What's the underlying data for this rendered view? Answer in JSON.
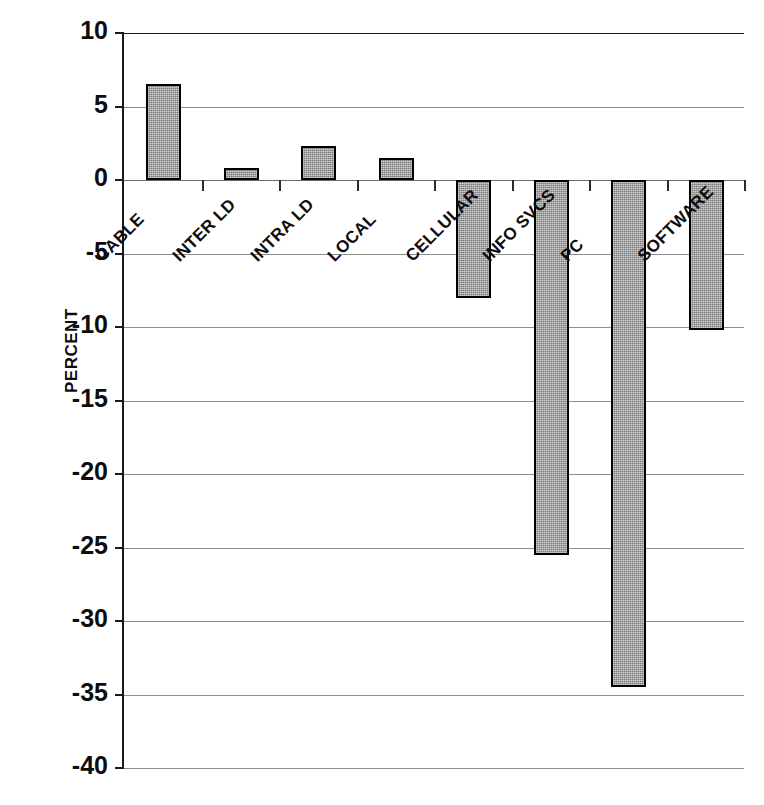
{
  "chart_data": {
    "type": "bar",
    "title": "",
    "xlabel": "",
    "ylabel": "PERCENT",
    "categories": [
      "CABLE",
      "INTER LD",
      "INTRA LD",
      "LOCAL",
      "CELLULAR",
      "INFO SVCS",
      "PC",
      "SOFTWARE"
    ],
    "values": [
      6.5,
      0.8,
      2.3,
      1.5,
      -8.0,
      -25.5,
      -34.5,
      -10.2
    ],
    "ylim": [
      -40,
      10
    ],
    "ytick_values": [
      10,
      5,
      0,
      -5,
      -10,
      -15,
      -20,
      -25,
      -30,
      -35,
      -40
    ],
    "ytick_labels": [
      "10",
      "5",
      "0",
      "-5",
      "-10",
      "-15",
      "-20",
      "-25",
      "-30",
      "-35",
      "-40"
    ],
    "grid": true,
    "legend": "none",
    "bar_fill_color": "#9e9e9e",
    "bar_edge_color": "#000000",
    "gridline_color": "#8c8c8c",
    "axis_color": "#1a1a1a",
    "label_rotation_deg": -45
  }
}
